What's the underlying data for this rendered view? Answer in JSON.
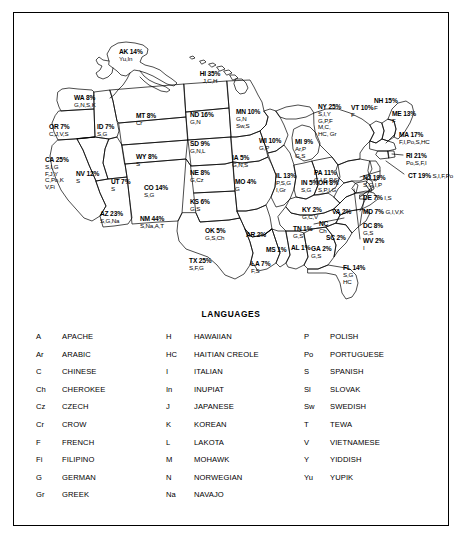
{
  "figure": {
    "legend_title": "LANGUAGES"
  },
  "map": {
    "states": [
      {
        "code": "AK",
        "pct": "14%",
        "langs": "Yu,In",
        "x": 105,
        "y": 36,
        "align": "left"
      },
      {
        "code": "HI",
        "pct": "35%",
        "langs": "J,C,H",
        "x": 196,
        "y": 58,
        "align": "center"
      },
      {
        "code": "WA",
        "pct": "8%",
        "langs": "G,N,S,K",
        "x": 60,
        "y": 82,
        "align": "left"
      },
      {
        "code": "OR",
        "pct": "7%",
        "langs": "C,J,V,S",
        "x": 35,
        "y": 111,
        "align": "left"
      },
      {
        "code": "ID",
        "pct": "7%",
        "langs": "S,G",
        "x": 83,
        "y": 111,
        "align": "left"
      },
      {
        "code": "MT",
        "pct": "8%",
        "langs": "Cr",
        "x": 122,
        "y": 100,
        "align": "left"
      },
      {
        "code": "ND",
        "pct": "16%",
        "langs": "G,N",
        "x": 176,
        "y": 99,
        "align": "left"
      },
      {
        "code": "SD",
        "pct": "9%",
        "langs": "G,N,L",
        "x": 176,
        "y": 128,
        "align": "left"
      },
      {
        "code": "NE",
        "pct": "8%",
        "langs": "G,Cz",
        "x": 176,
        "y": 157,
        "align": "left"
      },
      {
        "code": "KS",
        "pct": "6%",
        "langs": "G,S",
        "x": 176,
        "y": 186,
        "align": "left"
      },
      {
        "code": "MN",
        "pct": "10%",
        "langs": "G,N\nSw,S",
        "x": 222,
        "y": 96,
        "align": "left"
      },
      {
        "code": "WY",
        "pct": "8%",
        "langs": "S",
        "x": 122,
        "y": 141,
        "align": "left"
      },
      {
        "code": "CA",
        "pct": "25%",
        "langs": "S,I,G\nF,J,Y\nC,Po,K\nV,Fi",
        "x": 31,
        "y": 144,
        "align": "left"
      },
      {
        "code": "NV",
        "pct": "12%",
        "langs": "S",
        "x": 62,
        "y": 158,
        "align": "left"
      },
      {
        "code": "UT",
        "pct": "7%",
        "langs": "S",
        "x": 97,
        "y": 166,
        "align": "left"
      },
      {
        "code": "CO",
        "pct": "14%",
        "langs": "S,G",
        "x": 130,
        "y": 172,
        "align": "left"
      },
      {
        "code": "AZ",
        "pct": "23%",
        "langs": "S,G,Na",
        "x": 86,
        "y": 198,
        "align": "left"
      },
      {
        "code": "NM",
        "pct": "44%",
        "langs": "S,Na,A,T",
        "x": 126,
        "y": 203,
        "align": "left"
      },
      {
        "code": "OK",
        "pct": "5%",
        "langs": "G,S,Ch",
        "x": 191,
        "y": 215,
        "align": "left"
      },
      {
        "code": "TX",
        "pct": "25%",
        "langs": "S,F,G",
        "x": 175,
        "y": 245,
        "align": "left"
      },
      {
        "code": "IA",
        "pct": "5%",
        "langs": "G,N,S",
        "x": 218,
        "y": 142,
        "align": "left"
      },
      {
        "code": "MO",
        "pct": "4%",
        "langs": "G",
        "x": 221,
        "y": 166,
        "align": "left"
      },
      {
        "code": "AR",
        "pct": "2%",
        "langs": "",
        "x": 232,
        "y": 219,
        "align": "left"
      },
      {
        "code": "LA",
        "pct": "7%",
        "langs": "F,S",
        "x": 237,
        "y": 248,
        "align": "left"
      },
      {
        "code": "WI",
        "pct": "10%",
        "langs": "G,P",
        "x": 245,
        "y": 125,
        "align": "left"
      },
      {
        "code": "IL",
        "pct": "13%",
        "langs": "P,S,G\nI,Gr",
        "x": 262,
        "y": 160,
        "align": "left"
      },
      {
        "code": "MI",
        "pct": "9%",
        "langs": "Ar,P\nG,S",
        "x": 281,
        "y": 126,
        "align": "left"
      },
      {
        "code": "IN",
        "pct": "5%",
        "langs": "S,G",
        "x": 287,
        "y": 167,
        "align": "left"
      },
      {
        "code": "OH",
        "pct": "8%",
        "langs": "S,P,I,G",
        "x": 304,
        "y": 167,
        "align": "left"
      },
      {
        "code": "KY",
        "pct": "2%",
        "langs": "G,C,V",
        "x": 288,
        "y": 194,
        "align": "left"
      },
      {
        "code": "TN",
        "pct": "1%",
        "langs": "G,S",
        "x": 279,
        "y": 213,
        "align": "left"
      },
      {
        "code": "MS",
        "pct": "1%",
        "langs": "",
        "x": 252,
        "y": 234,
        "align": "left"
      },
      {
        "code": "AL",
        "pct": "1%",
        "langs": "",
        "x": 277,
        "y": 232,
        "align": "left"
      },
      {
        "code": "GA",
        "pct": "2%",
        "langs": "G,S",
        "x": 297,
        "y": 233,
        "align": "left"
      },
      {
        "code": "FL",
        "pct": "14%",
        "langs": "S,G\nHC",
        "x": 329,
        "y": 252,
        "align": "left"
      },
      {
        "code": "SC",
        "pct": "2%",
        "langs": "",
        "x": 312,
        "y": 222,
        "align": "left"
      },
      {
        "code": "NC",
        "pct": "",
        "langs": "Ch",
        "x": 305,
        "y": 208,
        "align": "left"
      },
      {
        "code": "VA",
        "pct": "2%",
        "langs": "",
        "x": 318,
        "y": 196,
        "align": "left"
      },
      {
        "code": "NY",
        "pct": "25%",
        "langs": "S,I,Y\nG,P,F\nM,C,\nHC, Gr",
        "x": 304,
        "y": 91,
        "align": "left"
      },
      {
        "code": "VT",
        "pct": "10%",
        "langs": "F",
        "x": 337,
        "y": 92,
        "align": "left"
      },
      {
        "code": "NH",
        "pct": "15%",
        "langs": "F",
        "x": 360,
        "y": 85,
        "align": "left"
      },
      {
        "code": "ME",
        "pct": "13%",
        "langs": "F",
        "x": 378,
        "y": 98,
        "align": "left"
      },
      {
        "code": "PA",
        "pct": "11%",
        "langs": "G,I,S,P,Sl",
        "x": 300,
        "y": 157,
        "align": "left"
      }
    ],
    "callouts": [
      {
        "code": "MA",
        "pct": "17%",
        "langs": "F,I,Po,S,HC",
        "x": 385,
        "y": 119
      },
      {
        "code": "RI",
        "pct": "21%",
        "langs": "Po,S,F,I",
        "x": 392,
        "y": 140
      },
      {
        "code": "CT",
        "pct": "19%",
        "langs": "S,I,F,Po",
        "x": 394,
        "y": 160
      },
      {
        "code": "NJ",
        "pct": "19%",
        "langs": "S,G,I,P",
        "x": 349,
        "y": 162
      },
      {
        "code": "DE",
        "pct": "7%",
        "langs": "I,S",
        "x": 349,
        "y": 182
      },
      {
        "code": "MD",
        "pct": "7%",
        "langs": "G,I,V,K",
        "x": 349,
        "y": 196
      },
      {
        "code": "DC",
        "pct": "8%",
        "langs": "G,S",
        "x": 349,
        "y": 210
      },
      {
        "code": "WV",
        "pct": "2%",
        "langs": "I",
        "x": 349,
        "y": 225
      }
    ]
  },
  "legend": {
    "columns": [
      {
        "entries": [
          {
            "abbr": "A",
            "name": "APACHE"
          },
          {
            "abbr": "Ar",
            "name": "ARABIC"
          },
          {
            "abbr": "C",
            "name": "CHINESE"
          },
          {
            "abbr": "Ch",
            "name": "CHEROKEE"
          },
          {
            "abbr": "Cz",
            "name": "CZECH"
          },
          {
            "abbr": "Cr",
            "name": "CROW"
          },
          {
            "abbr": "F",
            "name": "FRENCH"
          },
          {
            "abbr": "Fi",
            "name": "FILIPINO"
          },
          {
            "abbr": "G",
            "name": "GERMAN"
          },
          {
            "abbr": "Gr",
            "name": "GREEK"
          }
        ]
      },
      {
        "entries": [
          {
            "abbr": "H",
            "name": "HAWAIIAN"
          },
          {
            "abbr": "HC",
            "name": "HAITIAN CREOLE"
          },
          {
            "abbr": "I",
            "name": "ITALIAN"
          },
          {
            "abbr": "In",
            "name": "INUPIAT"
          },
          {
            "abbr": "J",
            "name": "JAPANESE"
          },
          {
            "abbr": "K",
            "name": "KOREAN"
          },
          {
            "abbr": "L",
            "name": "LAKOTA"
          },
          {
            "abbr": "M",
            "name": "MOHAWK"
          },
          {
            "abbr": "N",
            "name": "NORWEGIAN"
          },
          {
            "abbr": "Na",
            "name": "NAVAJO"
          }
        ]
      },
      {
        "entries": [
          {
            "abbr": "P",
            "name": "POLISH"
          },
          {
            "abbr": "Po",
            "name": "PORTUGUESE"
          },
          {
            "abbr": "S",
            "name": "SPANISH"
          },
          {
            "abbr": "Sl",
            "name": "SLOVAK"
          },
          {
            "abbr": "Sw",
            "name": "SWEDISH"
          },
          {
            "abbr": "T",
            "name": "TEWA"
          },
          {
            "abbr": "V",
            "name": "VIETNAMESE"
          },
          {
            "abbr": "Y",
            "name": "YIDDISH"
          },
          {
            "abbr": "Yu",
            "name": "YUPIK"
          }
        ]
      }
    ]
  },
  "chart_data": {
    "type": "map",
    "title": "LANGUAGES",
    "value_unit": "percent",
    "regions": [
      {
        "state": "AK",
        "value": 14,
        "languages": [
          "Yupik",
          "Inupiat"
        ]
      },
      {
        "state": "HI",
        "value": 35,
        "languages": [
          "Japanese",
          "Chinese",
          "Hawaiian"
        ]
      },
      {
        "state": "WA",
        "value": 8,
        "languages": [
          "German",
          "Norwegian",
          "Spanish",
          "Korean"
        ]
      },
      {
        "state": "OR",
        "value": 7,
        "languages": [
          "Chinese",
          "Japanese",
          "Vietnamese",
          "Spanish"
        ]
      },
      {
        "state": "ID",
        "value": 7,
        "languages": [
          "Spanish",
          "German"
        ]
      },
      {
        "state": "MT",
        "value": 8,
        "languages": [
          "Crow"
        ]
      },
      {
        "state": "ND",
        "value": 16,
        "languages": [
          "German",
          "Norwegian"
        ]
      },
      {
        "state": "SD",
        "value": 9,
        "languages": [
          "German",
          "Norwegian",
          "Lakota"
        ]
      },
      {
        "state": "NE",
        "value": 8,
        "languages": [
          "German",
          "Czech"
        ]
      },
      {
        "state": "KS",
        "value": 6,
        "languages": [
          "German",
          "Spanish"
        ]
      },
      {
        "state": "MN",
        "value": 10,
        "languages": [
          "German",
          "Norwegian",
          "Swedish",
          "Spanish"
        ]
      },
      {
        "state": "WY",
        "value": 8,
        "languages": [
          "Spanish"
        ]
      },
      {
        "state": "CA",
        "value": 25,
        "languages": [
          "Spanish",
          "Italian",
          "German",
          "French",
          "Japanese",
          "Yiddish",
          "Chinese",
          "Portuguese",
          "Korean",
          "Vietnamese",
          "Filipino"
        ]
      },
      {
        "state": "NV",
        "value": 12,
        "languages": [
          "Spanish"
        ]
      },
      {
        "state": "UT",
        "value": 7,
        "languages": [
          "Spanish"
        ]
      },
      {
        "state": "CO",
        "value": 14,
        "languages": [
          "Spanish",
          "German"
        ]
      },
      {
        "state": "AZ",
        "value": 23,
        "languages": [
          "Spanish",
          "German",
          "Navajo"
        ]
      },
      {
        "state": "NM",
        "value": 44,
        "languages": [
          "Spanish",
          "Navajo",
          "Apache",
          "Tewa"
        ]
      },
      {
        "state": "OK",
        "value": 5,
        "languages": [
          "German",
          "Spanish",
          "Cherokee"
        ]
      },
      {
        "state": "TX",
        "value": 25,
        "languages": [
          "Spanish",
          "French",
          "German"
        ]
      },
      {
        "state": "IA",
        "value": 5,
        "languages": [
          "German",
          "Norwegian",
          "Spanish"
        ]
      },
      {
        "state": "MO",
        "value": 4,
        "languages": [
          "German"
        ]
      },
      {
        "state": "AR",
        "value": 2,
        "languages": []
      },
      {
        "state": "LA",
        "value": 7,
        "languages": [
          "French",
          "Spanish"
        ]
      },
      {
        "state": "WI",
        "value": 10,
        "languages": [
          "German",
          "Polish"
        ]
      },
      {
        "state": "IL",
        "value": 13,
        "languages": [
          "Polish",
          "Spanish",
          "German",
          "Italian",
          "Greek"
        ]
      },
      {
        "state": "MI",
        "value": 9,
        "languages": [
          "Arabic",
          "Polish",
          "German",
          "Spanish"
        ]
      },
      {
        "state": "IN",
        "value": 5,
        "languages": [
          "Spanish",
          "German"
        ]
      },
      {
        "state": "OH",
        "value": 8,
        "languages": [
          "Spanish",
          "Polish",
          "Italian",
          "German"
        ]
      },
      {
        "state": "KY",
        "value": 2,
        "languages": [
          "German",
          "Chinese",
          "Vietnamese"
        ]
      },
      {
        "state": "TN",
        "value": 1,
        "languages": [
          "German",
          "Spanish"
        ]
      },
      {
        "state": "MS",
        "value": 1,
        "languages": []
      },
      {
        "state": "AL",
        "value": 1,
        "languages": []
      },
      {
        "state": "GA",
        "value": 2,
        "languages": [
          "German",
          "Spanish"
        ]
      },
      {
        "state": "FL",
        "value": 14,
        "languages": [
          "Spanish",
          "German",
          "Haitian Creole"
        ]
      },
      {
        "state": "SC",
        "value": 2,
        "languages": []
      },
      {
        "state": "NC",
        "value": 2,
        "languages": [
          "Cherokee"
        ]
      },
      {
        "state": "VA",
        "value": 2,
        "languages": []
      },
      {
        "state": "NY",
        "value": 25,
        "languages": [
          "Spanish",
          "Italian",
          "Yiddish",
          "German",
          "Polish",
          "French",
          "Mohawk",
          "Chinese",
          "Haitian Creole",
          "Greek"
        ]
      },
      {
        "state": "VT",
        "value": 10,
        "languages": [
          "French"
        ]
      },
      {
        "state": "NH",
        "value": 15,
        "languages": [
          "French"
        ]
      },
      {
        "state": "ME",
        "value": 13,
        "languages": [
          "French"
        ]
      },
      {
        "state": "PA",
        "value": 11,
        "languages": [
          "German",
          "Italian",
          "Spanish",
          "Polish",
          "Slovak"
        ]
      },
      {
        "state": "MA",
        "value": 17,
        "languages": [
          "French",
          "Italian",
          "Portuguese",
          "Spanish",
          "Haitian Creole"
        ]
      },
      {
        "state": "RI",
        "value": 21,
        "languages": [
          "Portuguese",
          "Spanish",
          "French",
          "Italian"
        ]
      },
      {
        "state": "CT",
        "value": 19,
        "languages": [
          "Spanish",
          "Italian",
          "French",
          "Portuguese"
        ]
      },
      {
        "state": "NJ",
        "value": 19,
        "languages": [
          "Spanish",
          "German",
          "Italian",
          "Polish"
        ]
      },
      {
        "state": "DE",
        "value": 7,
        "languages": [
          "Italian",
          "Spanish"
        ]
      },
      {
        "state": "MD",
        "value": 7,
        "languages": [
          "German",
          "Italian",
          "Vietnamese",
          "Korean"
        ]
      },
      {
        "state": "DC",
        "value": 8,
        "languages": [
          "German",
          "Spanish"
        ]
      },
      {
        "state": "WV",
        "value": 2,
        "languages": [
          "Italian"
        ]
      }
    ]
  }
}
